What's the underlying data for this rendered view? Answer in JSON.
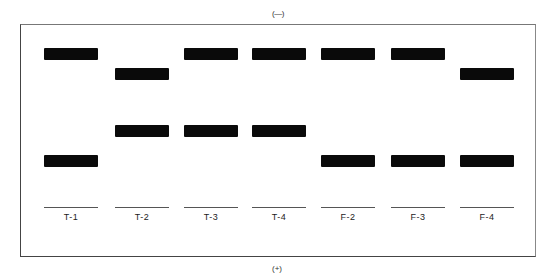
{
  "poles": {
    "top": "(—)",
    "bottom": "(+)"
  },
  "colors": {
    "band": "#0a0a0a",
    "frame": "#444444",
    "background": "#ffffff"
  },
  "band_positions": {
    "upper": 48,
    "second": 68,
    "middle": 125,
    "lower": 155
  },
  "lanes": [
    {
      "label": "T-1",
      "x": 44,
      "bands": [
        "upper",
        "lower"
      ]
    },
    {
      "label": "T-2",
      "x": 115,
      "bands": [
        "second",
        "middle"
      ]
    },
    {
      "label": "T-3",
      "x": 184,
      "bands": [
        "upper",
        "middle"
      ]
    },
    {
      "label": "T-4",
      "x": 252,
      "bands": [
        "upper",
        "middle"
      ]
    },
    {
      "label": "F-2",
      "x": 321,
      "bands": [
        "upper",
        "lower"
      ]
    },
    {
      "label": "F-3",
      "x": 391,
      "bands": [
        "upper",
        "lower"
      ]
    },
    {
      "label": "F-4",
      "x": 460,
      "bands": [
        "second",
        "lower"
      ]
    }
  ],
  "lane_width": 54,
  "well_y": 207,
  "label_y": 212
}
